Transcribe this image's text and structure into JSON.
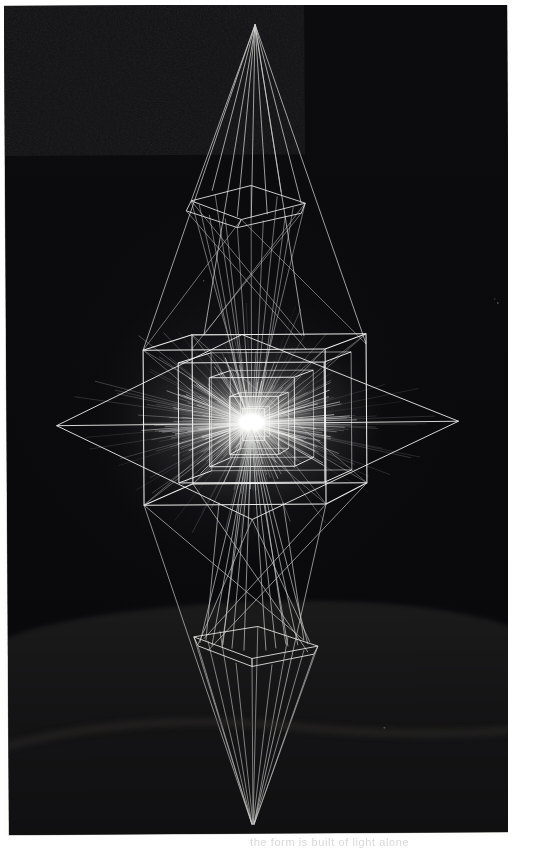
{
  "page": {
    "kind": "scanned-photographic-plate",
    "background_color": "#fdfdfc",
    "caption_fragment": "the form is built of light alone"
  },
  "photo": {
    "title": "Light-drawn wireframe sculpture",
    "medium": "long-exposure photograph of a luminous line construction",
    "frame_color": "#0a0a0c",
    "line_color": "#f2f3f0",
    "glow_color": "#ffffff",
    "floor_color": "#2e2c2a",
    "rotation_deg": -0.35,
    "width": 503,
    "height": 829
  },
  "scene": {
    "subject": "octahedral light construction with nested cubes",
    "structures": [
      {
        "name": "upper-apex",
        "type": "point",
        "x": 251,
        "y": 20
      },
      {
        "name": "upper-pyramid",
        "type": "pyramid",
        "apex_y": 20,
        "base_y": 205
      },
      {
        "name": "upper-square-frame",
        "type": "square",
        "cx": 240,
        "cy": 197,
        "w": 110,
        "h": 34
      },
      {
        "name": "outer-diamond",
        "type": "rhombus",
        "left_x": 50,
        "right_x": 452,
        "cy": 420,
        "top_y": 330,
        "bottom_y": 515
      },
      {
        "name": "main-cube",
        "type": "cube",
        "left_x": 137,
        "right_x": 360,
        "top_y": 333,
        "bottom_y": 500
      },
      {
        "name": "inner-cube-1",
        "type": "cube",
        "left_x": 172,
        "right_x": 318,
        "top_y": 355,
        "bottom_y": 480
      },
      {
        "name": "inner-cube-2",
        "type": "cube",
        "left_x": 200,
        "right_x": 288,
        "top_y": 372,
        "bottom_y": 462
      },
      {
        "name": "inner-cube-3",
        "type": "cube",
        "left_x": 222,
        "right_x": 268,
        "top_y": 392,
        "bottom_y": 448
      },
      {
        "name": "radiant-core",
        "type": "burst",
        "cx": 245,
        "cy": 418,
        "radius": 92
      },
      {
        "name": "lower-pyramid",
        "type": "pyramid",
        "base_y": 640,
        "apex_y": 820
      },
      {
        "name": "lower-square-frame",
        "type": "square",
        "cx": 248,
        "cy": 640,
        "w": 125,
        "h": 28
      },
      {
        "name": "lower-apex",
        "type": "point",
        "x": 243,
        "y": 820
      }
    ],
    "ground_horizon_y": 728
  }
}
